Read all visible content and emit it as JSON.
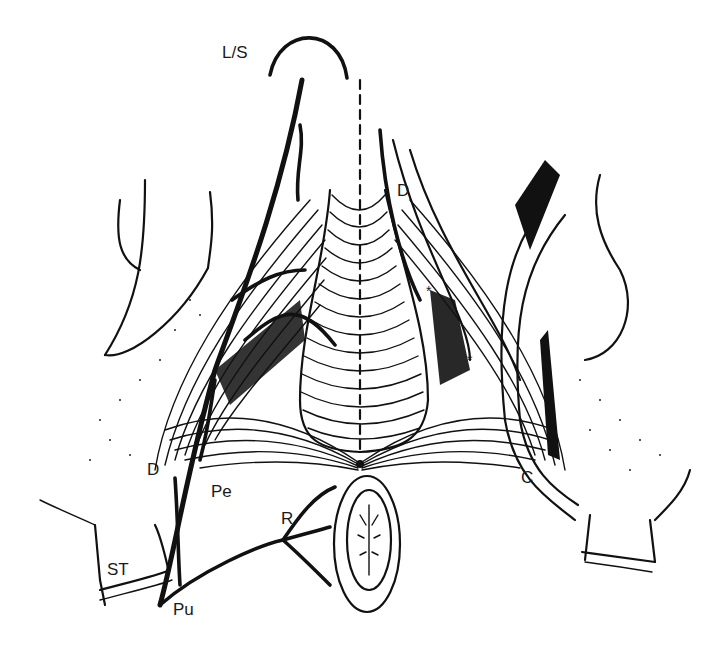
{
  "figure": {
    "background": "#ffffff",
    "ink": "#111111"
  },
  "labels": [
    {
      "id": "ls",
      "text": "L/S",
      "x": 222,
      "y": 58
    },
    {
      "id": "d-upper",
      "text": "D",
      "x": 397,
      "y": 196
    },
    {
      "id": "star-upper",
      "text": "*",
      "x": 426,
      "y": 296
    },
    {
      "id": "star-lower",
      "text": "*",
      "x": 467,
      "y": 365
    },
    {
      "id": "d-lower",
      "text": "D",
      "x": 147,
      "y": 475
    },
    {
      "id": "pe",
      "text": "Pe",
      "x": 211,
      "y": 497
    },
    {
      "id": "r",
      "text": "R",
      "x": 281,
      "y": 524
    },
    {
      "id": "c",
      "text": "C",
      "x": 521,
      "y": 483
    },
    {
      "id": "st",
      "text": "ST",
      "x": 107,
      "y": 575
    },
    {
      "id": "pu",
      "text": "Pu",
      "x": 173,
      "y": 615
    }
  ]
}
